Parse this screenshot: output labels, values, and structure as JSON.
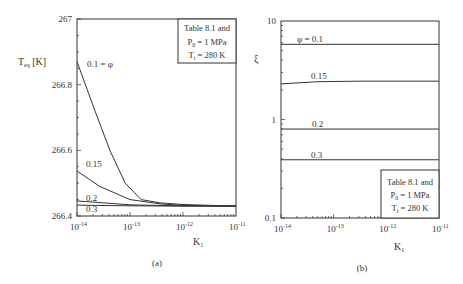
{
  "chart_data": [
    {
      "type": "line",
      "panel": "(a)",
      "title": "",
      "xlabel": "K_1",
      "ylabel": "T_eq [K]",
      "xscale": "log",
      "xlim": [
        1e-14,
        1e-11
      ],
      "ylim": [
        266.4,
        267
      ],
      "x_ticks": [
        {
          "value": 1e-14,
          "base": "10",
          "exp": "-14"
        },
        {
          "value": 1e-13,
          "base": "10",
          "exp": "-13"
        },
        {
          "value": 1e-12,
          "base": "10",
          "exp": "-12"
        },
        {
          "value": 1e-11,
          "base": "10",
          "exp": "-11"
        }
      ],
      "y_ticks": [
        "266.4",
        "266.6",
        "266.8",
        "267"
      ],
      "y_tick_values": [
        266.4,
        266.6,
        266.8,
        267
      ],
      "annotation_box": {
        "line1": "Table 8.1 and",
        "line2_main": "P",
        "line2_sub": "0",
        "line2_rest": " = 1 MPa",
        "line3_main": "T",
        "line3_sub": "i",
        "line3_rest": " = 280 K",
        "position": "top-right"
      },
      "series": [
        {
          "name": "0.1 = φ",
          "x_log": [
            -14,
            -13.66,
            -13.38,
            -13.09,
            -12.79,
            -12.43,
            -12.0,
            -11
          ],
          "values": [
            266.87,
            266.72,
            266.6,
            266.5,
            266.45,
            266.44,
            266.435,
            266.43
          ]
        },
        {
          "name": "0.15",
          "x_log": [
            -14,
            -13.57,
            -13.0,
            -12.43,
            -12.0,
            -11
          ],
          "values": [
            266.537,
            266.49,
            266.45,
            266.437,
            266.432,
            266.43
          ]
        },
        {
          "name": "0.2",
          "x_log": [
            -14,
            -13.5,
            -13.0,
            -12.0,
            -11
          ],
          "values": [
            266.446,
            266.44,
            266.434,
            266.431,
            266.43
          ]
        },
        {
          "name": "0.3",
          "x_log": [
            -14,
            -13.0,
            -12.0,
            -11
          ],
          "values": [
            266.433,
            266.431,
            266.43,
            266.43
          ]
        }
      ]
    },
    {
      "type": "line",
      "panel": "(b)",
      "title": "",
      "xlabel": "K_1",
      "ylabel": "ξ",
      "xscale": "log",
      "yscale": "log",
      "xlim": [
        1e-14,
        1e-11
      ],
      "ylim": [
        0.1,
        10
      ],
      "x_ticks": [
        {
          "value": 1e-14,
          "base": "10",
          "exp": "-14"
        },
        {
          "value": 1e-13,
          "base": "10",
          "exp": "-13"
        },
        {
          "value": 1e-12,
          "base": "10",
          "exp": "-12"
        },
        {
          "value": 1e-11,
          "base": "10",
          "exp": "-11"
        }
      ],
      "y_ticks": [
        "0.1",
        "1",
        "10"
      ],
      "y_tick_values": [
        0.1,
        1,
        10
      ],
      "annotation_box": {
        "line1": "Table 8.1 and",
        "line2_main": "P",
        "line2_sub": "0",
        "line2_rest": " = 1 MPa",
        "line3_main": "T",
        "line3_sub": "i",
        "line3_rest": " = 280 K",
        "position": "bottom-right"
      },
      "series": [
        {
          "name": "φ = 0.1",
          "x_log": [
            -14,
            -11
          ],
          "values": [
            5.8,
            5.8
          ]
        },
        {
          "name": "0.15",
          "x_log": [
            -14,
            -13.3,
            -12.5,
            -11
          ],
          "values": [
            2.3,
            2.42,
            2.45,
            2.45
          ]
        },
        {
          "name": "0.2",
          "x_log": [
            -14,
            -11
          ],
          "values": [
            0.8,
            0.8
          ]
        },
        {
          "name": "0.3",
          "x_log": [
            -14,
            -11
          ],
          "values": [
            0.39,
            0.39
          ]
        }
      ]
    }
  ]
}
